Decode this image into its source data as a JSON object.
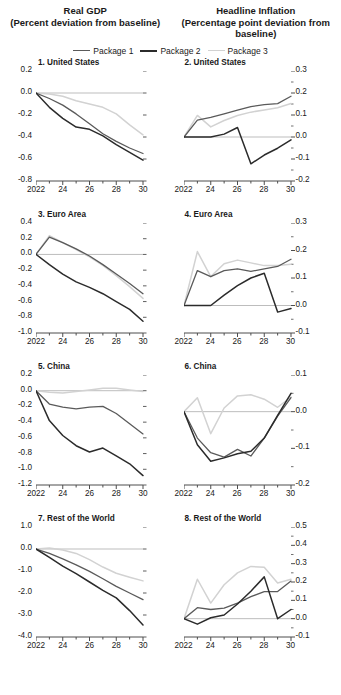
{
  "header": {
    "left_title": "Real GDP",
    "left_subtitle": "(Percent deviation from baseline)",
    "right_title": "Headline Inflation",
    "right_subtitle": "(Percentage point deviation from baseline)"
  },
  "legend": {
    "position": "top-center",
    "items": [
      {
        "label": "Package 1",
        "color": "#5a5a5a"
      },
      {
        "label": "Package 2",
        "color": "#2b2b2b"
      },
      {
        "label": "Package 3",
        "color": "#d2d2d2"
      }
    ]
  },
  "colors": {
    "package1": "#5a5a5a",
    "package2": "#2b2b2b",
    "package3": "#d2d2d2",
    "axis": "#4d4d4d",
    "zeroline": "#bdbdbd",
    "text": "#1a1a1a"
  },
  "chart_data": [
    {
      "type": "line",
      "panel": 1,
      "title": "1. United States",
      "group": "Real GDP",
      "xlabel": "",
      "ylabel": "",
      "x": [
        2022,
        2023,
        2024,
        2025,
        2026,
        2027,
        2028,
        2029,
        2030
      ],
      "xtick_labels": [
        "2022",
        "",
        "24",
        "",
        "26",
        "",
        "28",
        "",
        "30"
      ],
      "ytick_labels": [
        "0.2",
        "0.0",
        "-0.2",
        "-0.4",
        "-0.6",
        "-0.8"
      ],
      "ylim": [
        -0.8,
        0.2
      ],
      "yticks": [
        0.2,
        0.0,
        -0.2,
        -0.4,
        -0.6,
        -0.8
      ],
      "grid": false,
      "axis_side": "left",
      "series": [
        {
          "name": "Package 1",
          "values": [
            0.0,
            -0.05,
            -0.11,
            -0.19,
            -0.28,
            -0.37,
            -0.44,
            -0.5,
            -0.55
          ]
        },
        {
          "name": "Package 2",
          "values": [
            0.0,
            -0.13,
            -0.23,
            -0.31,
            -0.33,
            -0.39,
            -0.47,
            -0.54,
            -0.61
          ]
        },
        {
          "name": "Package 3",
          "values": [
            0.0,
            -0.01,
            -0.03,
            -0.07,
            -0.1,
            -0.13,
            -0.19,
            -0.29,
            -0.38
          ]
        }
      ]
    },
    {
      "type": "line",
      "panel": 2,
      "title": "2. United States",
      "group": "Headline Inflation",
      "xlabel": "",
      "ylabel": "",
      "x": [
        2022,
        2023,
        2024,
        2025,
        2026,
        2027,
        2028,
        2029,
        2030
      ],
      "xtick_labels": [
        "2022",
        "",
        "24",
        "",
        "26",
        "",
        "28",
        "",
        "30"
      ],
      "ytick_labels": [
        "0.3",
        "0.2",
        "0.1",
        "0.0",
        "-0.1",
        "-0.2"
      ],
      "ylim": [
        -0.2,
        0.3
      ],
      "yticks": [
        0.3,
        0.2,
        0.1,
        0.0,
        -0.1,
        -0.2
      ],
      "grid": false,
      "axis_side": "right",
      "series": [
        {
          "name": "Package 1",
          "values": [
            0.0,
            0.077,
            0.089,
            0.105,
            0.122,
            0.138,
            0.147,
            0.152,
            0.185
          ]
        },
        {
          "name": "Package 2",
          "values": [
            0.0,
            0.0,
            0.0,
            0.013,
            0.043,
            -0.122,
            -0.082,
            -0.051,
            -0.013
          ]
        },
        {
          "name": "Package 3",
          "values": [
            0.0,
            0.098,
            0.046,
            0.075,
            0.098,
            0.113,
            0.123,
            0.133,
            0.152
          ]
        }
      ]
    },
    {
      "type": "line",
      "panel": 3,
      "title": "3. Euro Area",
      "group": "Real GDP",
      "xlabel": "",
      "ylabel": "",
      "x": [
        2022,
        2023,
        2024,
        2025,
        2026,
        2027,
        2028,
        2029,
        2030
      ],
      "xtick_labels": [
        "2022",
        "",
        "24",
        "",
        "26",
        "",
        "28",
        "",
        "30"
      ],
      "ytick_labels": [
        "0.4",
        "0.2",
        "0.0",
        "-0.2",
        "-0.4",
        "-0.6",
        "-0.8",
        "-1.0"
      ],
      "ylim": [
        -1.0,
        0.4
      ],
      "yticks": [
        0.4,
        0.2,
        0.0,
        -0.2,
        -0.4,
        -0.6,
        -0.8,
        -1.0
      ],
      "grid": false,
      "axis_side": "left",
      "series": [
        {
          "name": "Package 1",
          "values": [
            0.0,
            0.22,
            0.15,
            0.07,
            -0.02,
            -0.13,
            -0.25,
            -0.37,
            -0.5
          ]
        },
        {
          "name": "Package 2",
          "values": [
            0.0,
            -0.13,
            -0.25,
            -0.35,
            -0.42,
            -0.5,
            -0.6,
            -0.7,
            -0.85
          ]
        },
        {
          "name": "Package 3",
          "values": [
            0.0,
            0.24,
            0.15,
            0.06,
            -0.03,
            -0.14,
            -0.27,
            -0.41,
            -0.56
          ]
        }
      ]
    },
    {
      "type": "line",
      "panel": 4,
      "title": "4. Euro Area",
      "group": "Headline Inflation",
      "xlabel": "",
      "ylabel": "",
      "x": [
        2022,
        2023,
        2024,
        2025,
        2026,
        2027,
        2028,
        2029,
        2030
      ],
      "xtick_labels": [
        "2022",
        "",
        "24",
        "",
        "26",
        "",
        "28",
        "",
        "30"
      ],
      "ytick_labels": [
        "0.3",
        "0.2",
        "0.1",
        "0.0",
        "-0.1"
      ],
      "ylim": [
        -0.1,
        0.3
      ],
      "yticks": [
        0.3,
        0.2,
        0.1,
        0.0,
        -0.1
      ],
      "grid": false,
      "axis_side": "right",
      "series": [
        {
          "name": "Package 1",
          "values": [
            0.0,
            0.127,
            0.105,
            0.127,
            0.133,
            0.124,
            0.133,
            0.142,
            0.168
          ]
        },
        {
          "name": "Package 2",
          "values": [
            0.0,
            0.0,
            0.0,
            0.038,
            0.072,
            0.1,
            0.117,
            -0.024,
            -0.011
          ]
        },
        {
          "name": "Package 3",
          "values": [
            0.0,
            0.196,
            0.105,
            0.152,
            0.165,
            0.155,
            0.145,
            0.145,
            0.15
          ]
        }
      ]
    },
    {
      "type": "line",
      "panel": 5,
      "title": "5. China",
      "group": "Real GDP",
      "xlabel": "",
      "ylabel": "",
      "x": [
        2022,
        2023,
        2024,
        2025,
        2026,
        2027,
        2028,
        2029,
        2030
      ],
      "xtick_labels": [
        "2022",
        "",
        "24",
        "",
        "26",
        "",
        "28",
        "",
        "30"
      ],
      "ytick_labels": [
        "0.2",
        "0.0",
        "-0.2",
        "-0.4",
        "-0.6",
        "-0.8",
        "-1.0",
        "-1.2"
      ],
      "ylim": [
        -1.2,
        0.2
      ],
      "yticks": [
        0.2,
        0.0,
        -0.2,
        -0.4,
        -0.6,
        -0.8,
        -1.0,
        -1.2
      ],
      "grid": false,
      "axis_side": "left",
      "series": [
        {
          "name": "Package 1",
          "values": [
            0.0,
            -0.17,
            -0.21,
            -0.23,
            -0.21,
            -0.2,
            -0.29,
            -0.42,
            -0.55
          ]
        },
        {
          "name": "Package 2",
          "values": [
            0.0,
            -0.38,
            -0.57,
            -0.7,
            -0.78,
            -0.73,
            -0.83,
            -0.93,
            -1.08
          ]
        },
        {
          "name": "Package 3",
          "values": [
            0.0,
            -0.02,
            -0.03,
            -0.01,
            0.01,
            0.03,
            0.03,
            0.01,
            -0.01
          ]
        }
      ]
    },
    {
      "type": "line",
      "panel": 6,
      "title": "6. China",
      "group": "Headline Inflation",
      "xlabel": "",
      "ylabel": "",
      "x": [
        2022,
        2023,
        2024,
        2025,
        2026,
        2027,
        2028,
        2029,
        2030
      ],
      "xtick_labels": [
        "2022",
        "",
        "24",
        "",
        "26",
        "",
        "28",
        "",
        "30"
      ],
      "ytick_labels": [
        "0.1",
        "0.0",
        "-0.1",
        "-0.2"
      ],
      "ylim": [
        -0.2,
        0.1
      ],
      "yticks": [
        0.1,
        0.0,
        -0.1,
        -0.2
      ],
      "grid": false,
      "axis_side": "right",
      "series": [
        {
          "name": "Package 1",
          "values": [
            0.0,
            -0.072,
            -0.112,
            -0.124,
            -0.103,
            -0.121,
            -0.072,
            -0.012,
            0.038
          ]
        },
        {
          "name": "Package 2",
          "values": [
            0.0,
            -0.09,
            -0.135,
            -0.126,
            -0.115,
            -0.108,
            -0.072,
            -0.01,
            0.05
          ]
        },
        {
          "name": "Package 3",
          "values": [
            0.0,
            0.038,
            -0.06,
            0.01,
            0.043,
            0.046,
            0.034,
            0.012,
            0.04
          ]
        }
      ]
    },
    {
      "type": "line",
      "panel": 7,
      "title": "7. Rest of the World",
      "group": "Real GDP",
      "xlabel": "",
      "ylabel": "",
      "x": [
        2022,
        2023,
        2024,
        2025,
        2026,
        2027,
        2028,
        2029,
        2030
      ],
      "xtick_labels": [
        "2022",
        "",
        "24",
        "",
        "26",
        "",
        "28",
        "",
        "30"
      ],
      "ytick_labels": [
        "1.0",
        "0.0",
        "-1.0",
        "-2.0",
        "-3.0",
        "-4.0"
      ],
      "ylim": [
        -4.0,
        1.0
      ],
      "yticks": [
        1.0,
        0.0,
        -1.0,
        -2.0,
        -3.0,
        -4.0
      ],
      "grid": false,
      "axis_side": "left",
      "series": [
        {
          "name": "Package 1",
          "values": [
            0.0,
            -0.2,
            -0.45,
            -0.72,
            -1.02,
            -1.35,
            -1.7,
            -2.0,
            -2.3
          ]
        },
        {
          "name": "Package 2",
          "values": [
            0.0,
            -0.38,
            -0.78,
            -1.12,
            -1.5,
            -1.88,
            -2.22,
            -2.8,
            -3.45
          ]
        },
        {
          "name": "Package 3",
          "values": [
            0.0,
            0.05,
            -0.05,
            -0.2,
            -0.48,
            -0.82,
            -1.1,
            -1.28,
            -1.45
          ]
        }
      ]
    },
    {
      "type": "line",
      "panel": 8,
      "title": "8. Rest of the World",
      "group": "Headline Inflation",
      "xlabel": "",
      "ylabel": "",
      "x": [
        2022,
        2023,
        2024,
        2025,
        2026,
        2027,
        2028,
        2029,
        2030
      ],
      "xtick_labels": [
        "2022",
        "",
        "24",
        "",
        "26",
        "",
        "28",
        "",
        "30"
      ],
      "ytick_labels": [
        "0.5",
        "0.4",
        "0.3",
        "0.2",
        "0.1",
        "0.0",
        "-0.1"
      ],
      "ylim": [
        -0.1,
        0.5
      ],
      "yticks": [
        0.5,
        0.4,
        0.3,
        0.2,
        0.1,
        0.0,
        -0.1
      ],
      "grid": false,
      "axis_side": "right",
      "series": [
        {
          "name": "Package 1",
          "values": [
            0.0,
            0.06,
            0.05,
            0.058,
            0.085,
            0.12,
            0.148,
            0.148,
            0.205
          ]
        },
        {
          "name": "Package 2",
          "values": [
            0.0,
            -0.03,
            0.005,
            0.02,
            0.08,
            0.15,
            0.228,
            0.0,
            0.05
          ]
        },
        {
          "name": "Package 3",
          "values": [
            0.0,
            0.215,
            0.085,
            0.185,
            0.25,
            0.285,
            0.28,
            0.195,
            0.215
          ]
        }
      ]
    }
  ]
}
